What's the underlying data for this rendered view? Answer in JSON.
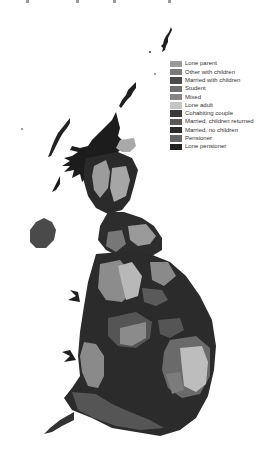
{
  "map": {
    "type": "cartogram",
    "region": "Great Britain",
    "description": "Grayscale population cartogram showing dominant household type by area"
  },
  "legend": {
    "items": [
      {
        "label": "Lone parent",
        "color": "#9a9a9a"
      },
      {
        "label": "Other with children",
        "color": "#7a7a7a"
      },
      {
        "label": "Married with children",
        "color": "#4a4a4a"
      },
      {
        "label": "Student",
        "color": "#6e6e6e"
      },
      {
        "label": "Mixed",
        "color": "#858585"
      },
      {
        "label": "Lone adult",
        "color": "#c4c4c4"
      },
      {
        "label": "Cohabiting couple",
        "color": "#3a3a3a"
      },
      {
        "label": "Married, children returned",
        "color": "#5a5a5a"
      },
      {
        "label": "Married, no children",
        "color": "#2a2a2a"
      },
      {
        "label": "Pensioner",
        "color": "#666666"
      },
      {
        "label": "Lone pensioner",
        "color": "#222222"
      }
    ]
  },
  "colors": {
    "background": "#ffffff",
    "text": "#333333"
  }
}
